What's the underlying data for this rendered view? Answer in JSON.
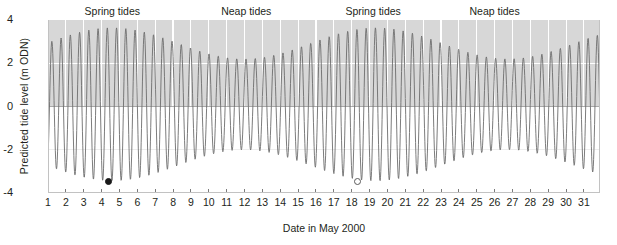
{
  "chart_data": {
    "type": "line",
    "title": "",
    "xlabel": "Date in May 2000",
    "ylabel": "Predicted tide level (m ODN)",
    "xlim": [
      1,
      31.9
    ],
    "ylim": [
      -4,
      4
    ],
    "yticks": [
      4,
      2,
      0,
      -2,
      -4
    ],
    "ytick_labels": [
      "4",
      "2",
      "0",
      "-2",
      "-4"
    ],
    "xticks": [
      1,
      2,
      3,
      4,
      5,
      6,
      7,
      8,
      9,
      10,
      11,
      12,
      13,
      14,
      15,
      16,
      17,
      18,
      19,
      20,
      21,
      22,
      23,
      24,
      25,
      26,
      27,
      28,
      29,
      30,
      31
    ],
    "xtick_labels": [
      "1",
      "2",
      "3",
      "4",
      "5",
      "6",
      "7",
      "8",
      "9",
      "10",
      "11",
      "12",
      "13",
      "14",
      "15",
      "16",
      "17",
      "18",
      "19",
      "20",
      "21",
      "22",
      "23",
      "24",
      "25",
      "26",
      "27",
      "28",
      "29",
      "30",
      "31"
    ],
    "grid": "vertical white gridlines at each day plus horizontal gridlines at y=2 and y=0",
    "legend": "none",
    "series_name": "Predicted tide level",
    "line_color": "#6d6d6d",
    "line_width": 0.9,
    "plot_background_upper": "#d7d7d7",
    "plot_background_lower": "#ffffff",
    "tide_model": {
      "cycles_per_day": 1.9322,
      "tide_phase_offset_days": 0.18,
      "mean_level_m": 0.1,
      "envelope_mean_amplitude_m": 2.82,
      "envelope_modulation_amplitude_m": 0.72,
      "envelope_period_days": 14.77,
      "envelope_peak_days": [
        4.6,
        19.4
      ],
      "samples_per_day": 56
    },
    "annotations": [
      {
        "label": "Spring tides",
        "x_day": 4.6
      },
      {
        "label": "Neap tides",
        "x_day": 12.1
      },
      {
        "label": "Spring tides",
        "x_day": 19.2
      },
      {
        "label": "Neap tides",
        "x_day": 26.0
      }
    ],
    "moon_markers": [
      {
        "phase": "new-moon",
        "x_day": 4.4,
        "y_level": -3.45,
        "style": "filled"
      },
      {
        "phase": "full-moon",
        "x_day": 18.3,
        "y_level": -3.45,
        "style": "open"
      }
    ],
    "envelope_notes": {
      "spring_high_max_m": 3.6,
      "spring_low_min_m": -3.5,
      "neap_high_max_m": 2.1,
      "neap_low_min_m": -2.0
    }
  }
}
